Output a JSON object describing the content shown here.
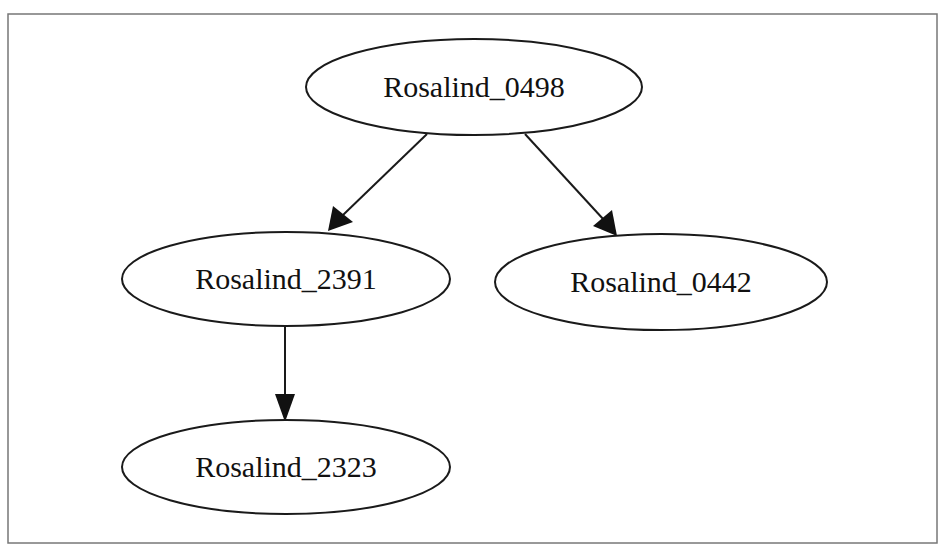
{
  "diagram": {
    "type": "directed-tree",
    "colors": {
      "stroke": "#1a1a1a",
      "background": "#ffffff",
      "frame": "#777777"
    },
    "nodes": [
      {
        "id": "n0498",
        "label": "Rosalind_0498",
        "cx": 474,
        "cy": 87,
        "rx": 168,
        "ry": 48
      },
      {
        "id": "n2391",
        "label": "Rosalind_2391",
        "cx": 286,
        "cy": 279,
        "rx": 164,
        "ry": 47
      },
      {
        "id": "n0442",
        "label": "Rosalind_0442",
        "cx": 661,
        "cy": 282,
        "rx": 166,
        "ry": 48
      },
      {
        "id": "n2323",
        "label": "Rosalind_2323",
        "cx": 286,
        "cy": 467,
        "rx": 164,
        "ry": 47
      }
    ],
    "edges": [
      {
        "from": "Rosalind_0498",
        "to": "Rosalind_2391"
      },
      {
        "from": "Rosalind_0498",
        "to": "Rosalind_0442"
      },
      {
        "from": "Rosalind_2391",
        "to": "Rosalind_2323"
      }
    ]
  }
}
